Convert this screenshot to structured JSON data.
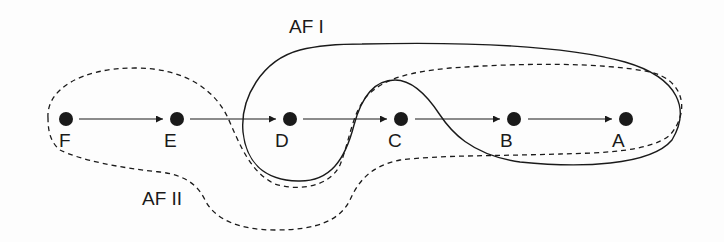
{
  "diagram": {
    "type": "chain-with-regions",
    "nodes": [
      {
        "id": "F",
        "label": "F",
        "x": 66,
        "y": 119
      },
      {
        "id": "E",
        "label": "E",
        "x": 177,
        "y": 119
      },
      {
        "id": "D",
        "label": "D",
        "x": 290,
        "y": 119
      },
      {
        "id": "C",
        "label": "C",
        "x": 401,
        "y": 119
      },
      {
        "id": "B",
        "label": "B",
        "x": 514,
        "y": 119
      },
      {
        "id": "A",
        "label": "A",
        "x": 626,
        "y": 119
      }
    ],
    "edges": [
      {
        "from": "F",
        "to": "E"
      },
      {
        "from": "E",
        "to": "D"
      },
      {
        "from": "D",
        "to": "C"
      },
      {
        "from": "C",
        "to": "B"
      },
      {
        "from": "B",
        "to": "A"
      }
    ],
    "regions": [
      {
        "id": "af1",
        "label": "AF I",
        "style": "solid",
        "contains": [
          "D",
          "B",
          "A"
        ]
      },
      {
        "id": "af2",
        "label": "AF II",
        "style": "dashed",
        "contains": [
          "F",
          "E",
          "C",
          "B",
          "A"
        ]
      }
    ],
    "colors": {
      "ink": "#1a1a1a",
      "background": "#fdfdfd"
    }
  }
}
